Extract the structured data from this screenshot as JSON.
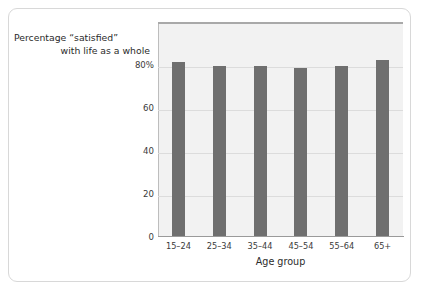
{
  "caption": {
    "line1": "Percentage “satisfied”",
    "line2": "with life as a whole"
  },
  "colors": {
    "bar": "#6f6f6f",
    "plot_background": "#f2f2f2",
    "gridline": "#dcdcdc",
    "card_border": "#d8d8d8",
    "text": "#2b2b2b"
  },
  "chart_data": {
    "type": "bar",
    "title": "",
    "subtitle": "",
    "categories": [
      "15–24",
      "25–34",
      "35–44",
      "45–54",
      "55–64",
      "65+"
    ],
    "values": [
      81,
      79,
      79,
      78,
      79,
      82
    ],
    "series": [
      {
        "name": "Percentage “satisfied” with life as a whole",
        "values": [
          81,
          79,
          79,
          78,
          79,
          82
        ]
      }
    ],
    "xlabel": "Age group",
    "ylabel": "Percentage “satisfied” with life as a whole",
    "ylim": [
      0,
      100
    ],
    "yticks": [
      0,
      20,
      40,
      60,
      80
    ],
    "ytick_labels": [
      "0",
      "20",
      "40",
      "60",
      "80%"
    ],
    "grid": true,
    "legend": false,
    "legend_position": "none",
    "annotations": []
  }
}
